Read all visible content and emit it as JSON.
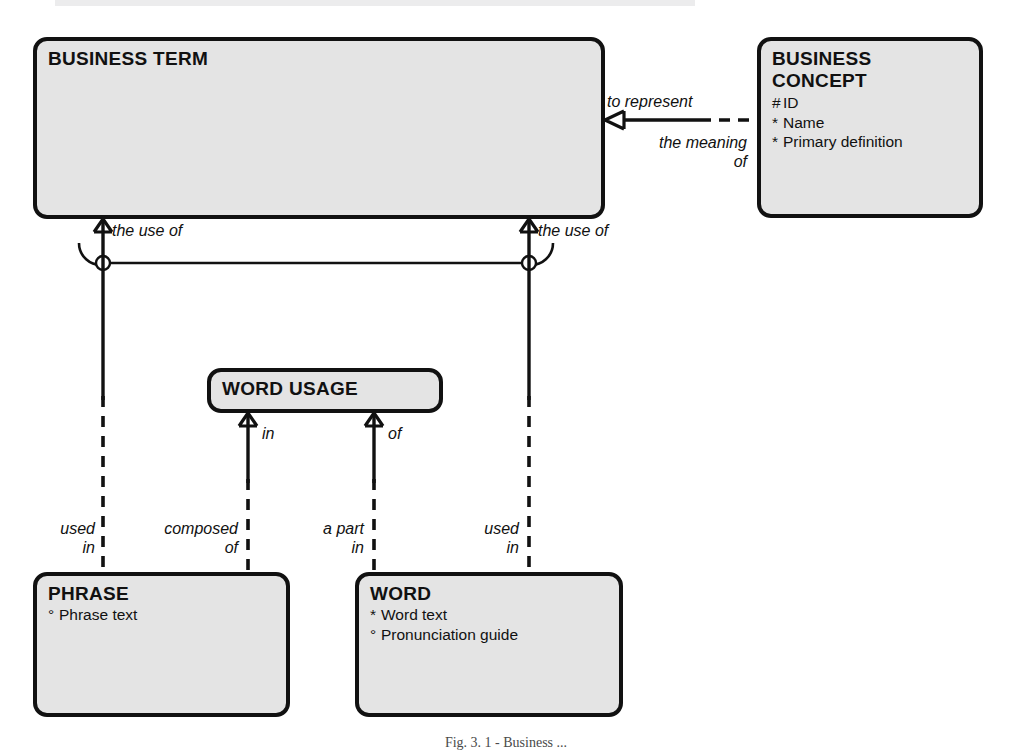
{
  "diagram": {
    "title_caption": "Fig. 3. 1 - Business ...",
    "entities": [
      {
        "id": "business-term",
        "name": "BUSINESS TERM",
        "name_lines": [
          "BUSINESS TERM"
        ],
        "attributes": [],
        "x": 33,
        "y": 37,
        "w": 572,
        "h": 182
      },
      {
        "id": "business-concept",
        "name": "BUSINESS CONCEPT",
        "name_lines": [
          "BUSINESS",
          "CONCEPT"
        ],
        "attributes": [
          {
            "mark": "#",
            "label": "ID"
          },
          {
            "mark": "*",
            "label": "Name"
          },
          {
            "mark": "*",
            "label": "Primary definition"
          }
        ],
        "x": 757,
        "y": 37,
        "w": 226,
        "h": 181
      },
      {
        "id": "word-usage",
        "name": "WORD USAGE",
        "name_lines": [
          "WORD USAGE"
        ],
        "attributes": [],
        "x": 207,
        "y": 368,
        "w": 236,
        "h": 45
      },
      {
        "id": "phrase",
        "name": "PHRASE",
        "name_lines": [
          "PHRASE"
        ],
        "attributes": [
          {
            "mark": "°",
            "label": "Phrase text"
          }
        ],
        "x": 33,
        "y": 572,
        "w": 257,
        "h": 145
      },
      {
        "id": "word",
        "name": "WORD",
        "name_lines": [
          "WORD"
        ],
        "attributes": [
          {
            "mark": "*",
            "label": "Word text"
          },
          {
            "mark": "°",
            "label": "Pronunciation guide"
          }
        ],
        "x": 355,
        "y": 572,
        "w": 268,
        "h": 145
      }
    ],
    "relationship_labels": [
      {
        "id": "to-represent",
        "text": "to represent",
        "align": "left",
        "x": 607,
        "y": 92
      },
      {
        "id": "the-meaning-of",
        "text": "the meaning\nof",
        "align": "right",
        "x": 597,
        "y": 133,
        "w": 150
      },
      {
        "id": "the-use-of-left",
        "text": "the use of",
        "align": "left",
        "x": 112,
        "y": 221
      },
      {
        "id": "the-use-of-right",
        "text": "the use of",
        "align": "left",
        "x": 538,
        "y": 221
      },
      {
        "id": "in-wordusage",
        "text": "in",
        "align": "left",
        "x": 262,
        "y": 424
      },
      {
        "id": "of-wordusage",
        "text": "of",
        "align": "left",
        "x": 388,
        "y": 424
      },
      {
        "id": "used-in-phrase",
        "text": "used\nin",
        "align": "right",
        "x": 6,
        "y": 519,
        "w": 89
      },
      {
        "id": "composed-of-phrase",
        "text": "composed\nof",
        "align": "right",
        "x": 110,
        "y": 519,
        "w": 138
      },
      {
        "id": "a-part-in-word",
        "text": "a part\nin",
        "align": "right",
        "x": 260,
        "y": 519,
        "w": 111
      },
      {
        "id": "used-in-word",
        "text": "used\nin",
        "align": "right",
        "x": 430,
        "y": 519,
        "w": 89
      }
    ],
    "colors": {
      "entity_fill": "#e4e4e4",
      "entity_stroke": "#111111",
      "line": "#111111",
      "background": "#ffffff",
      "caption": "#4a4a4a"
    }
  }
}
